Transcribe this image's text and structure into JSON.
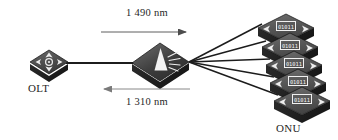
{
  "diagram": {
    "background": "#ffffff",
    "nodes": {
      "olt": {
        "label": "OLT",
        "icon": "router-icon",
        "body_color": "#3a3a3a",
        "edge_color": "#1b1b1b"
      },
      "splitter": {
        "label": "",
        "icon": "optical-splitter-icon",
        "body_color": "#3d3d3d",
        "edge_color": "#151515",
        "beam_color": "#f2f2f2"
      },
      "onu": {
        "label": "ONU",
        "icon": "onu-device-icon",
        "count": 5,
        "display_text": "01011",
        "body_color": "#4a4a4a",
        "edge_color": "#1a1a1a"
      }
    },
    "links": {
      "feeder_color": "#1c1c1c",
      "distribution_color": "#1c1c1c",
      "distribution_count": 5
    },
    "annotations": [
      {
        "id": "downstream",
        "text": "1 490 nm",
        "direction": "right",
        "arrow_color": "#5b5b5b"
      },
      {
        "id": "upstream",
        "text": "1 310 nm",
        "direction": "left",
        "arrow_color": "#7a7a7a"
      }
    ]
  }
}
